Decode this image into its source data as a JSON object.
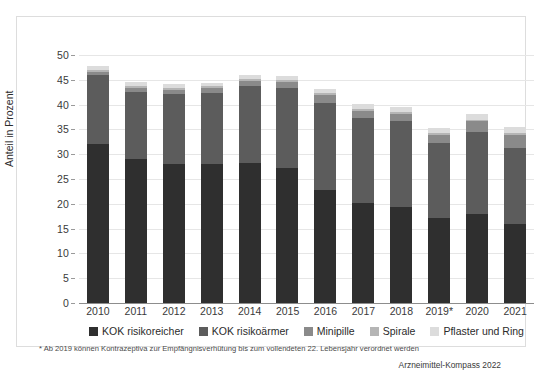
{
  "chart_data": {
    "type": "bar",
    "subtype": "stacked-bar",
    "title": "",
    "xlabel": "",
    "ylabel": "Anteil in Prozent",
    "ylim": [
      0,
      50
    ],
    "ytick_step": 5,
    "yticks": [
      0,
      5,
      10,
      15,
      20,
      25,
      30,
      35,
      40,
      45,
      50
    ],
    "grid": true,
    "legend_position": "bottom",
    "categories": [
      "2010",
      "2011",
      "2012",
      "2013",
      "2014",
      "2015",
      "2016",
      "2017",
      "2018",
      "2019*",
      "2020",
      "2021"
    ],
    "series": [
      {
        "name": "KOK risikoreicher",
        "color": "#2f2f2f",
        "values": [
          32.0,
          29.0,
          28.0,
          28.0,
          28.3,
          27.3,
          22.8,
          20.2,
          19.3,
          17.2,
          18.0,
          16.0
        ]
      },
      {
        "name": "KOK risikoärmer",
        "color": "#5c5c5c",
        "values": [
          13.9,
          13.6,
          14.1,
          14.4,
          15.4,
          16.0,
          17.6,
          17.1,
          17.3,
          15.0,
          16.4,
          15.2
        ]
      },
      {
        "name": "Minipille",
        "color": "#8a8a8a",
        "values": [
          0.6,
          0.8,
          0.9,
          0.9,
          1.0,
          1.2,
          1.5,
          1.5,
          1.6,
          1.7,
          2.2,
          2.6
        ]
      },
      {
        "name": "Spirale",
        "color": "#b5b5b5",
        "values": [
          0.4,
          0.4,
          0.4,
          0.4,
          0.4,
          0.4,
          0.4,
          0.4,
          0.4,
          0.4,
          0.4,
          0.4
        ]
      },
      {
        "name": "Pflaster und Ring",
        "color": "#dcdcdc",
        "values": [
          0.8,
          0.8,
          0.7,
          0.7,
          0.8,
          0.8,
          0.8,
          0.9,
          0.9,
          0.9,
          1.1,
          1.3
        ]
      }
    ],
    "totals": [
      47.7,
      44.6,
      44.1,
      44.4,
      45.9,
      45.7,
      43.1,
      40.1,
      39.5,
      35.2,
      38.1,
      35.5
    ],
    "footnote": "* Ab 2019 können Kontrazeptiva zur Empfängnisverhütung bis zum vollendeten 22. Lebensjahr verordnet werden",
    "source": "Arzneimittel-Kompass 2022"
  }
}
